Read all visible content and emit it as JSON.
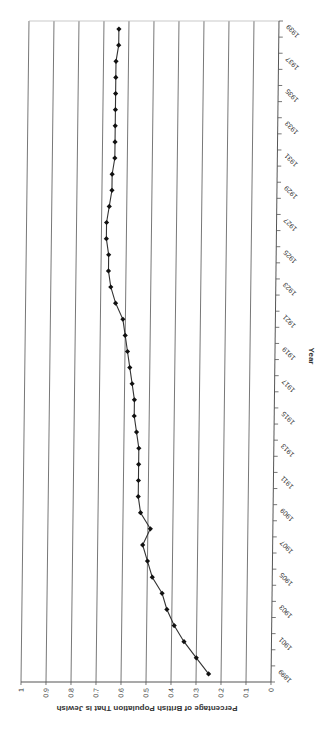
{
  "chart_data": {
    "type": "line",
    "orientation": "rotated -90deg (years vertical, percentage horizontal)",
    "title": "",
    "xlabel": "Year",
    "ylabel": "Percentage of British Population That is Jewish",
    "ylim": [
      0,
      1
    ],
    "yticks": [
      "0",
      "0.1",
      "0.2",
      "0.3",
      "0.4",
      "0.5",
      "0.6",
      "0.7",
      "0.8",
      "0.9",
      "1"
    ],
    "xtick_labels": [
      "1899",
      "1901",
      "1903",
      "1905",
      "1907",
      "1909",
      "1911",
      "1913",
      "1915",
      "1917",
      "1919",
      "1921",
      "1923",
      "1925",
      "1927",
      "1929",
      "1931",
      "1933",
      "1935",
      "1937",
      "1939"
    ],
    "grid": true,
    "legend": null,
    "marker": "diamond",
    "line_color": "#333333",
    "x": [
      1899,
      1900,
      1901,
      1902,
      1903,
      1904,
      1905,
      1906,
      1907,
      1908,
      1909,
      1910,
      1911,
      1912,
      1913,
      1914,
      1915,
      1916,
      1917,
      1918,
      1919,
      1920,
      1921,
      1922,
      1923,
      1924,
      1925,
      1926,
      1927,
      1928,
      1929,
      1930,
      1931,
      1932,
      1933,
      1934,
      1935,
      1936,
      1937,
      1938,
      1939
    ],
    "series": [
      {
        "name": "Percentage of British Population That is Jewish",
        "values": [
          0.25,
          0.3,
          0.35,
          0.39,
          0.42,
          0.44,
          0.48,
          0.5,
          0.52,
          0.49,
          0.53,
          0.54,
          0.54,
          0.54,
          0.54,
          0.55,
          0.56,
          0.56,
          0.57,
          0.58,
          0.59,
          0.6,
          0.61,
          0.64,
          0.66,
          0.67,
          0.67,
          0.68,
          0.68,
          0.67,
          0.66,
          0.66,
          0.65,
          0.65,
          0.65,
          0.65,
          0.65,
          0.65,
          0.65,
          0.64,
          0.64
        ]
      }
    ]
  }
}
